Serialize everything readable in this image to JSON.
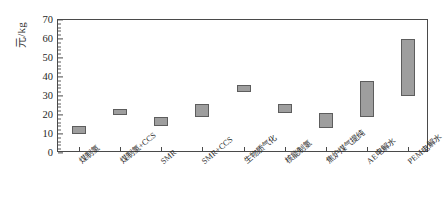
{
  "chart_data": {
    "type": "bar",
    "subtype": "floating-range-bar",
    "title": "",
    "subtitle": "",
    "xlabel": "",
    "ylabel": "元/kg",
    "ylim": [
      0,
      70
    ],
    "ytick_step": 10,
    "yminor_step": 2,
    "grid": false,
    "legend": null,
    "categories": [
      "煤制氢",
      "煤制氢+CCS",
      "SMR",
      "SMR+CCS",
      "生物质气化",
      "核能制氢",
      "焦炉煤气提纯",
      "AE电解水",
      "PEM电解水"
    ],
    "ytick_labels": [
      "0",
      "10",
      "20",
      "30",
      "40",
      "50",
      "60",
      "70"
    ],
    "ytick_values": [
      0,
      10,
      20,
      30,
      40,
      50,
      60,
      70
    ],
    "series": [
      {
        "name": "氢气成本区间",
        "low": [
          10,
          20,
          14,
          19,
          32,
          21,
          13,
          19,
          30
        ],
        "high": [
          14,
          23,
          19,
          26,
          36,
          26,
          21,
          38,
          60
        ]
      }
    ],
    "bar_fill_color": "#9e9e9e",
    "bar_edge_color": "#5d5d5d",
    "axis_color": "#4a4a4a",
    "background_color": "#ffffff"
  }
}
